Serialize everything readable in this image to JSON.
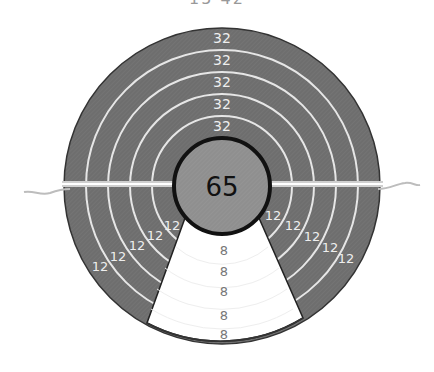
{
  "game": {
    "type": "target-score-board",
    "top_label": "15 42",
    "center_score": "65",
    "top_ring_scores": [
      "32",
      "32",
      "32",
      "32",
      "32"
    ],
    "left_ring_scores": [
      "12",
      "12",
      "12",
      "12",
      "12"
    ],
    "right_ring_scores": [
      "12",
      "12",
      "12",
      "12",
      "12"
    ],
    "bottom_wedge_scores": [
      "8",
      "8",
      "8",
      "8",
      "8"
    ],
    "colors": {
      "board_fill": "#6e6e6e",
      "ring_lines": "#e6e6e6",
      "center_fill": "#8f8f8f",
      "center_border": "#111111",
      "wedge_fill": "#ffffff",
      "divider": "#f2f2f2"
    }
  }
}
